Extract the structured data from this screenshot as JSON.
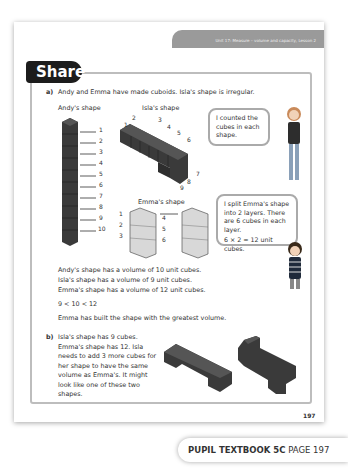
{
  "header": {
    "unit_title": "Unit 17: Measure – volume and capacity, Lesson 2",
    "section_tab": "Share"
  },
  "part_a": {
    "marker": "a)",
    "intro": "Andy and Emma have made cuboids. Isla's shape is irregular.",
    "andy_label": "Andy's shape",
    "isla_label": "Isla's shape",
    "emma_label": "Emma's shape",
    "andy_numbers": [
      "1",
      "2",
      "3",
      "4",
      "5",
      "6",
      "7",
      "8",
      "9",
      "10"
    ],
    "isla_numbers": [
      "1",
      "2",
      "3",
      "4",
      "5",
      "6",
      "7",
      "8",
      "9"
    ],
    "emma_numbers": [
      "1",
      "2",
      "3",
      "4",
      "5",
      "6"
    ],
    "bubble_girl": "I counted the cubes in each shape.",
    "bubble_boy_line1": "I split Emma's shape into 2 layers. There are 6 cubes in each layer.",
    "bubble_boy_line2": "6 × 2 = 12 unit cubes.",
    "statements": [
      "Andy's shape has a volume of 10 unit cubes.",
      "Isla's shape has a volume of 9 unit cubes.",
      "Emma's shape has a volume of 12 unit cubes."
    ],
    "comparison": "9 < 10 < 12",
    "conclusion": "Emma has built the shape with the greatest volume."
  },
  "part_b": {
    "marker": "b)",
    "text": "Isla's shape has 9 cubes. Emma's shape has 12. Isla needs to add 3 more cubes for her shape to have the same volume as Emma's. It might look like one of these two shapes."
  },
  "footer": {
    "page_number": "197",
    "book": "PUPIL TEXTBOOK 5C",
    "page_label": "PAGE 197"
  },
  "colors": {
    "tab_bg": "#1c1c1c",
    "banner_bg": "#9a9a9a",
    "cube": "#3a3a3a",
    "frame": "#bdbdbd"
  }
}
